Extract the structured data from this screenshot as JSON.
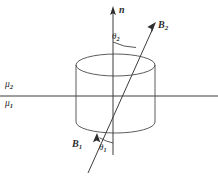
{
  "figure": {
    "kind": "physics-diagram",
    "width": 218,
    "height": 179,
    "background_color": "#ffffff",
    "line_color": "#3c3c3c",
    "text_color": "#2b2b2b"
  },
  "labels": {
    "normal_axis": {
      "symbol": "n",
      "subscript": ""
    },
    "field_upper": {
      "symbol": "B",
      "subscript": "2"
    },
    "field_lower": {
      "symbol": "B",
      "subscript": "1"
    },
    "angle_upper": {
      "symbol": "θ",
      "subscript": "2"
    },
    "angle_lower": {
      "symbol": "θ",
      "subscript": "1"
    },
    "permeability_upper": {
      "symbol": "μ",
      "subscript": "2"
    },
    "permeability_lower": {
      "symbol": "μ",
      "subscript": "1"
    }
  },
  "geometry": {
    "interface_line": {
      "x1": 0,
      "y1": 96,
      "x2": 218,
      "y2": 96
    },
    "normal_axis": {
      "x1": 113,
      "y1": 155,
      "x2": 113,
      "y2": 8
    },
    "field_line": {
      "x1": 88,
      "y1": 173,
      "x2": 156,
      "y2": 23
    },
    "cylinder": {
      "left": 76,
      "right": 155,
      "top_center_y": 65,
      "bottom_center_y": 122,
      "ellipse_ry": 11
    },
    "arc_upper": {
      "cx": 113,
      "cy": 96,
      "r": 54
    },
    "arc_lower": {
      "cx": 113,
      "cy": 96,
      "r": 47
    }
  }
}
